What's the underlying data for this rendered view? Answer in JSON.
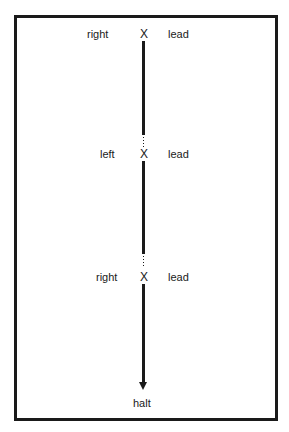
{
  "diagram": {
    "type": "sequence-path",
    "stations": [
      {
        "side_label": "right",
        "mark": "X",
        "action_label": "lead"
      },
      {
        "side_label": "left",
        "mark": "X",
        "action_label": "lead"
      },
      {
        "side_label": "right",
        "mark": "X",
        "action_label": "lead"
      }
    ],
    "end_label": "halt",
    "colors": {
      "line": "#1a1a1a",
      "background": "#ffffff"
    }
  }
}
